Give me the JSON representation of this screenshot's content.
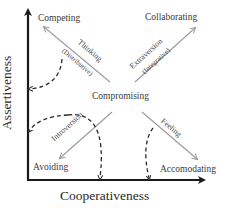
{
  "axes": {
    "x_label": "Cooperativeness",
    "y_label": "Assertiveness"
  },
  "modes": {
    "top_left": "Competing",
    "top_right": "Collaborating",
    "center": "Compromising",
    "bottom_left": "Avoiding",
    "bottom_right": "Accomodating"
  },
  "arrows": {
    "nw": {
      "label": "Thinking",
      "sublabel": "(Distributive)"
    },
    "ne": {
      "label": "Extraversion",
      "sublabel": "(Integrative)"
    },
    "sw": {
      "label": "Introversion"
    },
    "se": {
      "label": "Feeling"
    }
  },
  "colors": {
    "axis": "#1a1a1a",
    "arrow": "#9a9a9a",
    "dashed": "#2a2a2a",
    "text": "#3a3a3a"
  }
}
